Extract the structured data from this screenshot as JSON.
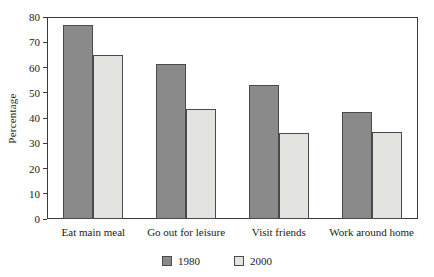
{
  "chart_data": {
    "type": "bar",
    "title": "",
    "xlabel": "",
    "ylabel": "Percentage",
    "ylim": [
      0,
      80
    ],
    "ytick_step": 10,
    "yticks": [
      0,
      10,
      20,
      30,
      40,
      50,
      60,
      70,
      80
    ],
    "grid": false,
    "legend_position": "bottom-center",
    "categories": [
      "Eat main meal",
      "Go out for leisure",
      "Visit friends",
      "Work around home"
    ],
    "series": [
      {
        "name": "1980",
        "color": "#8a8a8a",
        "values": [
          77,
          61.5,
          53,
          42.5
        ]
      },
      {
        "name": "2000",
        "color": "#e3e3e0",
        "values": [
          65,
          43.5,
          34,
          34.5
        ]
      }
    ]
  },
  "colors": {
    "series_1980": "#8a8a8a",
    "series_2000": "#e3e3e0",
    "axis": "#3a3a3a",
    "bar_border": "#4a4a4a",
    "background": "#ffffff",
    "text": "#1a1a1a"
  }
}
